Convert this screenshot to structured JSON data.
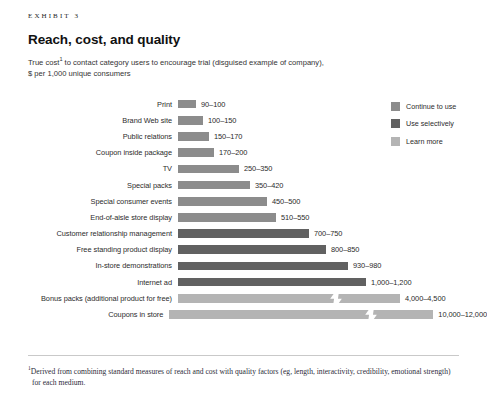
{
  "header": {
    "eyebrow": "EXHIBIT 3",
    "title": "Reach, cost, and quality",
    "subtitle_line1": "True cost",
    "subtitle_footnote_marker": "1",
    "subtitle_line1_rest": " to contact category users to encourage trial (disguised example of company),",
    "subtitle_line2": "$ per 1,000 unique consumers"
  },
  "legend": {
    "items": [
      {
        "label": "Continue to use",
        "color": "#8c8c8c"
      },
      {
        "label": "Use selectively",
        "color": "#616161"
      },
      {
        "label": "Learn more",
        "color": "#b4b4b4"
      }
    ]
  },
  "footer": {
    "footnote_marker": "1",
    "footnote": "Derived from combining standard measures of reach and cost with quality factors (eg, length, interactivity, credibility, emotional strength) for each medium."
  },
  "chart_data": {
    "type": "bar",
    "orientation": "horizontal",
    "title": "Reach, cost, and quality",
    "subtitle": "True cost to contact category users to encourage trial (disguised example of company), $ per 1,000 unique consumers",
    "xlabel": "$ per 1,000 unique consumers",
    "ylabel": "",
    "grid": false,
    "legend_position": "right",
    "series_names": [
      "Continue to use",
      "Use selectively",
      "Learn more"
    ],
    "categories": [
      "Print",
      "Brand Web site",
      "Public relations",
      "Coupon inside package",
      "TV",
      "Special packs",
      "Special consumer events",
      "End-of-aisle store display",
      "Customer relationship management",
      "Free standing product display",
      "In-store demonstrations",
      "Internet ad",
      "Bonus packs (additional product for free)",
      "Coupons in store"
    ],
    "bars": [
      {
        "category": "Print",
        "value_label": "90–100",
        "low": 90,
        "high": 100,
        "group": "Continue to use",
        "color": "#8c8c8c",
        "bar_px": 18,
        "broken": false
      },
      {
        "category": "Brand Web site",
        "value_label": "100–150",
        "low": 100,
        "high": 150,
        "group": "Continue to use",
        "color": "#8c8c8c",
        "bar_px": 25,
        "broken": false
      },
      {
        "category": "Public relations",
        "value_label": "150–170",
        "low": 150,
        "high": 170,
        "group": "Continue to use",
        "color": "#8c8c8c",
        "bar_px": 31,
        "broken": false
      },
      {
        "category": "Coupon inside package",
        "value_label": "170–200",
        "low": 170,
        "high": 200,
        "group": "Continue to use",
        "color": "#8c8c8c",
        "bar_px": 36,
        "broken": false
      },
      {
        "category": "TV",
        "value_label": "250–350",
        "low": 250,
        "high": 350,
        "group": "Continue to use",
        "color": "#8c8c8c",
        "bar_px": 61,
        "broken": false
      },
      {
        "category": "Special packs",
        "value_label": "350–420",
        "low": 350,
        "high": 420,
        "group": "Continue to use",
        "color": "#8c8c8c",
        "bar_px": 72,
        "broken": false
      },
      {
        "category": "Special consumer events",
        "value_label": "450–500",
        "low": 450,
        "high": 500,
        "group": "Continue to use",
        "color": "#8c8c8c",
        "bar_px": 89,
        "broken": false
      },
      {
        "category": "End-of-aisle store display",
        "value_label": "510–550",
        "low": 510,
        "high": 550,
        "group": "Continue to use",
        "color": "#8c8c8c",
        "bar_px": 98,
        "broken": false
      },
      {
        "category": "Customer relationship management",
        "value_label": "700–750",
        "low": 700,
        "high": 750,
        "group": "Use selectively",
        "color": "#616161",
        "bar_px": 131,
        "broken": false
      },
      {
        "category": "Free standing product display",
        "value_label": "800–850",
        "low": 800,
        "high": 850,
        "group": "Use selectively",
        "color": "#616161",
        "bar_px": 148,
        "broken": false
      },
      {
        "category": "In-store demonstrations",
        "value_label": "930–980",
        "low": 930,
        "high": 980,
        "group": "Use selectively",
        "color": "#616161",
        "bar_px": 170,
        "broken": false
      },
      {
        "category": "Internet ad",
        "value_label": "1,000–1,200",
        "low": 1000,
        "high": 1200,
        "group": "Use selectively",
        "color": "#616161",
        "bar_px": 188,
        "broken": false
      },
      {
        "category": "Bonus packs (additional product for free)",
        "value_label": "4,000–4,500",
        "low": 4000,
        "high": 4500,
        "group": "Learn more",
        "color": "#b4b4b4",
        "bar_px": 222,
        "broken": true,
        "break_px": 152
      },
      {
        "category": "Coupons in store",
        "value_label": "10,000–12,000",
        "low": 10000,
        "high": 12000,
        "group": "Learn more",
        "color": "#b4b4b4",
        "bar_px": 264,
        "broken": true,
        "break_px": 196
      }
    ]
  }
}
